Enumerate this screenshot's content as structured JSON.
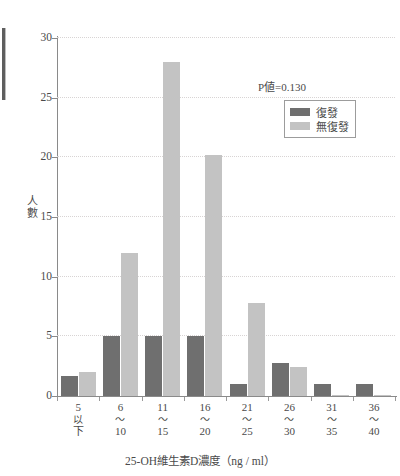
{
  "chart_data": {
    "type": "bar",
    "title": "",
    "xlabel": "25-OH維生素D濃度（ng / ml）",
    "ylabel": "人數",
    "ylim": [
      0,
      30
    ],
    "yticks": [
      0,
      5,
      10,
      15,
      20,
      25,
      30
    ],
    "grid": true,
    "legend_position": "top-right",
    "annotation": "P値=0.130",
    "categories": [
      "5以下",
      "6〜10",
      "11〜15",
      "16〜20",
      "21〜25",
      "26〜30",
      "31〜35",
      "36〜40"
    ],
    "category_lines": [
      [
        "5",
        "以",
        "下"
      ],
      [
        "6",
        "〜",
        "10"
      ],
      [
        "11",
        "〜",
        "15"
      ],
      [
        "16",
        "〜",
        "20"
      ],
      [
        "21",
        "〜",
        "25"
      ],
      [
        "26",
        "〜",
        "30"
      ],
      [
        "31",
        "〜",
        "35"
      ],
      [
        "36",
        "〜",
        "40"
      ]
    ],
    "series": [
      {
        "name": "復發",
        "color": "#6f6f6f",
        "values": [
          1.7,
          5,
          5,
          5,
          1,
          2.8,
          1,
          1
        ]
      },
      {
        "name": "無復發",
        "color": "#c3c3c3",
        "values": [
          2,
          12,
          28,
          20.2,
          7.8,
          2.4,
          0.1,
          0.1
        ]
      }
    ]
  },
  "axes": {
    "y_tick_labels": [
      "0",
      "5",
      "10",
      "15",
      "20",
      "25",
      "30"
    ],
    "y_title_chars": [
      "人",
      "數"
    ],
    "x_title": "25-OH維生素D濃度（ng / ml）"
  },
  "legend": {
    "items": [
      {
        "label": "復發",
        "swatch": "relapse"
      },
      {
        "label": "無復發",
        "swatch": "norelapse"
      }
    ]
  },
  "annotation": {
    "pvalue_text": "P値=0.130"
  },
  "colors": {
    "relapse": "#6f6f6f",
    "norelapse": "#c3c3c3",
    "axis": "#8a8a8a",
    "grid": "#d8d4d4",
    "text": "#4a4a4a"
  }
}
